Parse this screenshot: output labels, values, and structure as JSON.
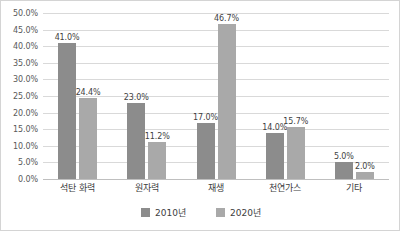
{
  "chart_data": {
    "type": "bar",
    "title": "",
    "subtitle": "",
    "xlabel": "",
    "ylabel": "",
    "categories": [
      "석탄 화력",
      "원자력",
      "재생",
      "천연가스",
      "기타"
    ],
    "series": [
      {
        "name": "2010년",
        "color": "#8c8c8c",
        "values": [
          41.0,
          23.0,
          17.0,
          14.0,
          5.0
        ],
        "value_labels": [
          "41.0%",
          "23.0%",
          "17.0%",
          "14.0%",
          "5.0%"
        ]
      },
      {
        "name": "2020년",
        "color": "#a9a9a9",
        "values": [
          24.4,
          11.2,
          46.7,
          15.7,
          2.0
        ],
        "value_labels": [
          "24.4%",
          "11.2%",
          "46.7%",
          "15.7%",
          "2.0%"
        ]
      }
    ],
    "ylim": [
      0,
      50
    ],
    "ytick_step": 5,
    "ytick_labels": [
      "0.0%",
      "5.0%",
      "10.0%",
      "15.0%",
      "20.0%",
      "25.0%",
      "30.0%",
      "35.0%",
      "40.0%",
      "45.0%",
      "50.0%"
    ],
    "grid": "horizontal",
    "legend_position": "bottom-center"
  },
  "colors": {
    "series_2010": "#8c8c8c",
    "series_2020": "#a9a9a9",
    "gridline": "#d9d9d9",
    "axis": "#bfbfbf",
    "frame_border": "#d4d4d4",
    "tick_text": "#595959",
    "label_text": "#404040"
  }
}
